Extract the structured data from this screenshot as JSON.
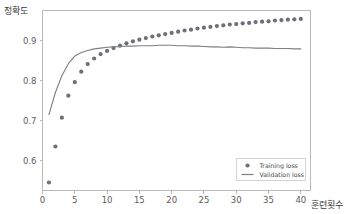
{
  "chart_data": {
    "type": "scatter",
    "title": "",
    "xlabel": "훈련횟수",
    "ylabel": "정확도",
    "xlim": [
      0,
      41.5
    ],
    "ylim": [
      0.525,
      0.975
    ],
    "xticks": [
      0,
      5,
      10,
      15,
      20,
      25,
      30,
      35,
      40
    ],
    "xticklabels": [
      "0",
      "5",
      "10",
      "15",
      "20",
      "25",
      "30",
      "35",
      "40"
    ],
    "yticks": [
      0.6,
      0.7,
      0.8,
      0.9
    ],
    "yticklabels": [
      "0.6",
      "0.7",
      "0.8",
      "0.9"
    ],
    "grid": false,
    "legend_position": "lower right",
    "colors": {
      "training": "#6e7078",
      "validation": "#7b7f86",
      "axis": "#b9b9b9",
      "text": "#5b5b5b",
      "background": "#ffffff"
    },
    "series": [
      {
        "name": "Training loss",
        "marker": "dot",
        "x": [
          1,
          2,
          3,
          4,
          5,
          6,
          7,
          8,
          9,
          10,
          11,
          12,
          13,
          14,
          15,
          16,
          17,
          18,
          19,
          20,
          21,
          22,
          23,
          24,
          25,
          26,
          27,
          28,
          29,
          30,
          31,
          32,
          33,
          34,
          35,
          36,
          37,
          38,
          39,
          40
        ],
        "values": [
          0.545,
          0.635,
          0.707,
          0.762,
          0.796,
          0.822,
          0.841,
          0.855,
          0.866,
          0.874,
          0.881,
          0.887,
          0.893,
          0.898,
          0.902,
          0.906,
          0.91,
          0.913,
          0.916,
          0.919,
          0.922,
          0.925,
          0.927,
          0.93,
          0.932,
          0.934,
          0.936,
          0.938,
          0.94,
          0.941,
          0.943,
          0.944,
          0.946,
          0.947,
          0.948,
          0.95,
          0.951,
          0.952,
          0.953,
          0.954
        ]
      },
      {
        "name": "Validation loss",
        "marker": "line",
        "x": [
          1,
          2,
          3,
          4,
          5,
          6,
          7,
          8,
          9,
          10,
          11,
          12,
          13,
          14,
          15,
          16,
          17,
          18,
          19,
          20,
          21,
          22,
          23,
          24,
          25,
          26,
          27,
          28,
          29,
          30,
          31,
          32,
          33,
          34,
          35,
          36,
          37,
          38,
          39,
          40
        ],
        "values": [
          0.715,
          0.77,
          0.812,
          0.842,
          0.861,
          0.87,
          0.875,
          0.879,
          0.881,
          0.883,
          0.884,
          0.885,
          0.886,
          0.886,
          0.887,
          0.887,
          0.887,
          0.888,
          0.888,
          0.888,
          0.887,
          0.887,
          0.886,
          0.886,
          0.885,
          0.884,
          0.884,
          0.883,
          0.884,
          0.883,
          0.882,
          0.882,
          0.881,
          0.881,
          0.881,
          0.88,
          0.88,
          0.88,
          0.879,
          0.879
        ]
      }
    ],
    "legend": [
      {
        "label": "Training loss",
        "marker": "dot"
      },
      {
        "label": "Validation loss",
        "marker": "line"
      }
    ]
  }
}
